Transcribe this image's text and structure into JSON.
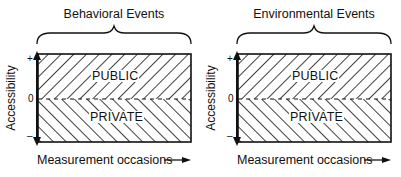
{
  "panels": [
    {
      "title": "Behavioral Events",
      "y_axis_label": "Accessibility",
      "x_axis_label": "Measurement occasions",
      "ticks": {
        "plus": "+",
        "zero": "0",
        "minus": "–"
      },
      "regions": {
        "upper": "PUBLIC",
        "lower": "PRIVATE"
      }
    },
    {
      "title": "Environmental Events",
      "y_axis_label": "Accessibility",
      "x_axis_label": "Measurement occasions",
      "ticks": {
        "plus": "+",
        "zero": "0",
        "minus": "–"
      },
      "regions": {
        "upper": "PUBLIC",
        "lower": "PRIVATE"
      }
    }
  ],
  "colors": {
    "ink": "#111111",
    "background": "#ffffff"
  }
}
